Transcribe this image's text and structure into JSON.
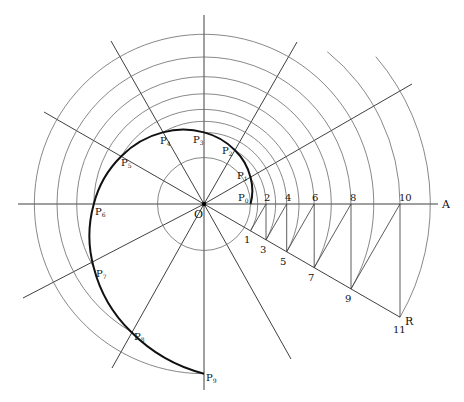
{
  "diagram": {
    "title": "",
    "origin_label": "O",
    "axis_label": "A",
    "ray_label": "R",
    "spiral_points": [
      {
        "label": "P",
        "sub": "0"
      },
      {
        "label": "P",
        "sub": "1"
      },
      {
        "label": "P",
        "sub": "2"
      },
      {
        "label": "P",
        "sub": "3"
      },
      {
        "label": "P",
        "sub": "4"
      },
      {
        "label": "P",
        "sub": "5"
      },
      {
        "label": "P",
        "sub": "6"
      },
      {
        "label": "P",
        "sub": "7"
      },
      {
        "label": "P",
        "sub": "8"
      },
      {
        "label": "P",
        "sub": "9"
      }
    ],
    "axis_points": [
      "2",
      "4",
      "6",
      "8",
      "10"
    ],
    "ray_points": [
      "1",
      "3",
      "5",
      "7",
      "9",
      "11"
    ],
    "construction": {
      "radial_line_spacing_deg": 30,
      "ratio_per_step": "1 / cos 30°",
      "ray_angle_deg": -30
    },
    "colors": {
      "background": "#ffffff",
      "spiral": "#111111",
      "circles": "#6a6a6a",
      "rays": "#2a2a2a"
    }
  }
}
